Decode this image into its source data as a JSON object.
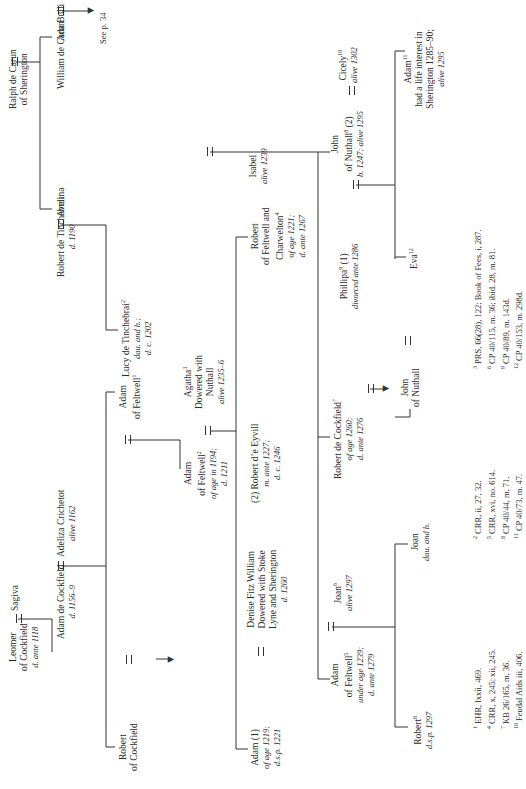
{
  "persons": {
    "leomer": {
      "name": "Leomer",
      "line2": "of Cockfield",
      "note": "d. ante 1118"
    },
    "sagiva": {
      "name": "Sagiva"
    },
    "adam_cockfield": {
      "name": "Adam de Cockfield",
      "note": "d. 1156–9"
    },
    "adeliza": {
      "name": "Adeliza Crichetot",
      "note": "alive 1162"
    },
    "robert_cockfield": {
      "name": "Robert",
      "line2": "of Cockfield"
    },
    "adam_feltwell_1": {
      "name": "Adam",
      "line2": "of Feltwell",
      "sup": "1"
    },
    "robert_tinchebrai": {
      "name": "Robert de Tinchebrai",
      "note": "d. 1190"
    },
    "avelina": {
      "name": "Avelina"
    },
    "ralph_carun": {
      "name": "Ralph de Carun",
      "line2": "of Sherington"
    },
    "william_carun": {
      "name": "William de Carun"
    },
    "ada_bulli": {
      "name": "Ada Bulli"
    },
    "see_p": {
      "text": "See p. 34"
    },
    "lucy": {
      "name": "Lucy de Tinchebrai",
      "sup": "2",
      "note1": "dau. and h.;",
      "note2": "d. c. 1202"
    },
    "adam_feltwell_2": {
      "name": "Adam",
      "line2": "of Feltwell",
      "sup": "2",
      "note1": "of age in 1194;",
      "note2": "d. 1211"
    },
    "agatha": {
      "name": "Agatha",
      "sup": "3",
      "line2": "Dowered with",
      "line3": "Nuthall",
      "note": "alive 1235–6"
    },
    "adam_1": {
      "name": "Adam (1)",
      "note1": "of age 1219;",
      "note2": "d.s.p. 1221"
    },
    "denise": {
      "name": "Denise Fitz William",
      "line2": "Dowered with Stoke",
      "line3": "Lyne and Sherington",
      "note": "d. 1260"
    },
    "robert_eyvill": {
      "name": "(2) Robert d’e Eyvill",
      "note1": "m. ante 1227;",
      "note2": "d. c. 1246"
    },
    "robert_feltwell": {
      "name": "Robert",
      "line2": "of Feltwell and",
      "line3": "Charwelton",
      "sup": "4",
      "note1": "of age 1221;",
      "note2": "d. ante 1267"
    },
    "isabel": {
      "name": "Isabel",
      "note": "alive 1239"
    },
    "adam_feltwell_5": {
      "name": "Adam",
      "line2": "of Feltwell",
      "sup": "5",
      "note1": "under age 1239;",
      "note2": "d. ante 1279"
    },
    "joan_6": {
      "name": "Joan",
      "sup": "6",
      "note": "alive 1297"
    },
    "robert_cockfield_7": {
      "name": "Robert de Cockfield",
      "sup": "7",
      "note1": "of age 1260;",
      "note2": "d. ante 1276"
    },
    "phillipa": {
      "name": "Phillipa",
      "sup": "9",
      "suffix": " (1)",
      "note": "divorced ante 1286"
    },
    "john_nuthall_8": {
      "name": "John",
      "line2": "of Nuthall",
      "sup": "8",
      "suffix": " (2)",
      "note": "b. 1247; alive 1295"
    },
    "cicely": {
      "name": "Cicely",
      "sup": "10",
      "note": "alive 1302"
    },
    "robert_8": {
      "name": "Robert",
      "sup": "8",
      "note": "d.s.p. 1297"
    },
    "joan_dau": {
      "name": "Joan",
      "note": "dau. and h."
    },
    "john_nuthall": {
      "name": "John",
      "line2": "of Nuthall"
    },
    "eva": {
      "name": "Eva",
      "sup": "12"
    },
    "adam_11": {
      "name": "Adam",
      "sup": "11",
      "line2": "had a life interest in",
      "line3": "Sherington 1285–90;",
      "note": "alive 1295"
    }
  },
  "footnotes": {
    "col1": [
      {
        "n": "1",
        "text": "EHR, lxxii, 469."
      },
      {
        "n": "4",
        "text": "CRR, x, 245; xii, 245."
      },
      {
        "n": "7",
        "text": "KB 26/165, m. 36."
      },
      {
        "n": "10",
        "text": "Feudal Aids iii, 406."
      }
    ],
    "col2": [
      {
        "n": "2",
        "text": "CRR, ii, 27, 32."
      },
      {
        "n": "5",
        "text": "CRR, xvi, no. 614."
      },
      {
        "n": "8",
        "text": "CP 40/44, m. 71."
      },
      {
        "n": "11",
        "text": "CP 40/73, m. 47."
      }
    ],
    "col3": [
      {
        "n": "3",
        "text": "PRS, 66(28), 122; Book of Fees, i, 287."
      },
      {
        "n": "6",
        "text": "CP 40/115, m. 36; ibid. 28, m. 81."
      },
      {
        "n": "9",
        "text": "CP 40/89, m. 143d."
      },
      {
        "n": "12",
        "text": "CP 40/153, m. 298d."
      }
    ]
  }
}
